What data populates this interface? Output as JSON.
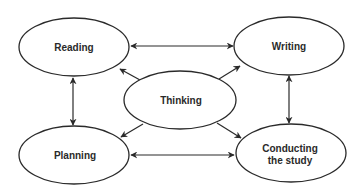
{
  "diagram": {
    "type": "process-cycle",
    "nodes": [
      {
        "id": "reading",
        "label_lines": [
          "Reading"
        ],
        "cx": 74,
        "cy": 47,
        "rx": 55,
        "ry": 29
      },
      {
        "id": "writing",
        "label_lines": [
          "Writing"
        ],
        "cx": 289,
        "cy": 46,
        "rx": 55,
        "ry": 29
      },
      {
        "id": "thinking",
        "label_lines": [
          "Thinking"
        ],
        "cx": 180,
        "cy": 100,
        "rx": 56,
        "ry": 29
      },
      {
        "id": "planning",
        "label_lines": [
          "Planning"
        ],
        "cx": 74,
        "cy": 155,
        "rx": 55,
        "ry": 29
      },
      {
        "id": "conducting",
        "label_lines": [
          "Conducting",
          "the study"
        ],
        "cx": 291,
        "cy": 153,
        "rx": 55,
        "ry": 29
      }
    ],
    "edges": [
      {
        "from": "reading",
        "to": "writing",
        "direction": "both"
      },
      {
        "from": "planning",
        "to": "conducting",
        "direction": "both"
      },
      {
        "from": "reading",
        "to": "planning",
        "direction": "both"
      },
      {
        "from": "writing",
        "to": "conducting",
        "direction": "both"
      },
      {
        "from": "thinking",
        "to": "reading",
        "direction": "forward"
      },
      {
        "from": "thinking",
        "to": "writing",
        "direction": "forward"
      },
      {
        "from": "thinking",
        "to": "planning",
        "direction": "forward"
      },
      {
        "from": "thinking",
        "to": "conducting",
        "direction": "forward"
      }
    ],
    "colors": {
      "stroke": "#2a2a2a",
      "fill": "#ffffff",
      "text": "#2a2a2a"
    }
  },
  "labels": {
    "reading": "Reading",
    "writing": "Writing",
    "thinking": "Thinking",
    "planning": "Planning",
    "conducting_line1": "Conducting",
    "conducting_line2": "the study"
  }
}
